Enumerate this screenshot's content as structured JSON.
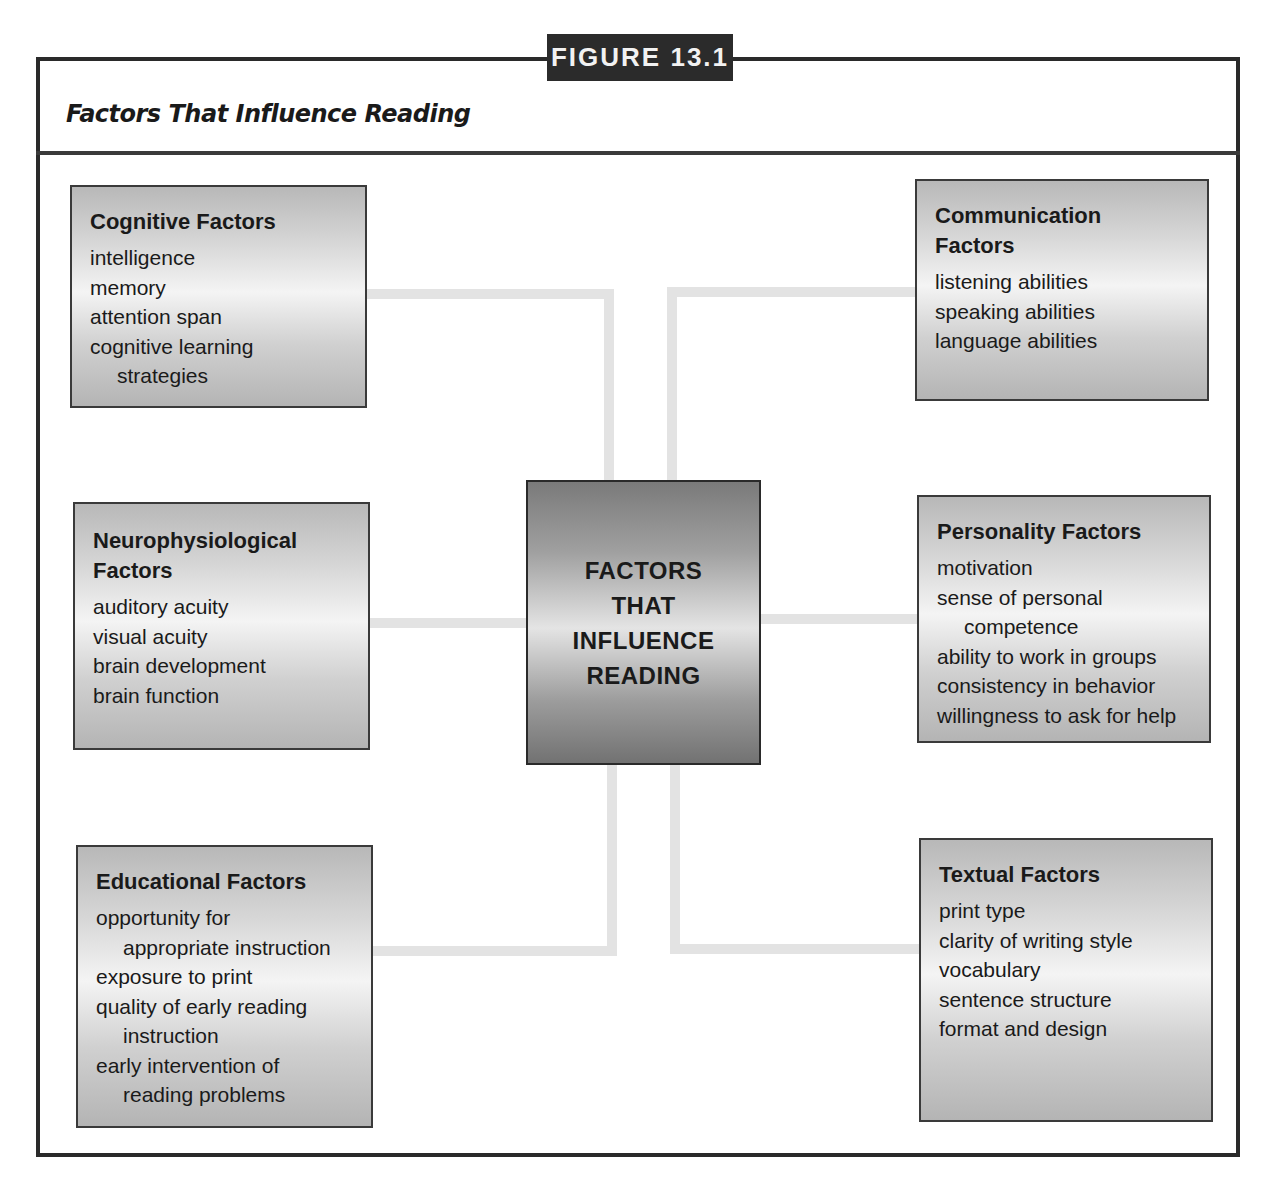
{
  "figure": {
    "label": "FIGURE 13.1",
    "title": "Factors That Influence Reading"
  },
  "center": {
    "lines": [
      "FACTORS",
      "THAT",
      "INFLUENCE",
      "READING"
    ]
  },
  "factors": {
    "cognitive": {
      "title": "Cognitive Factors",
      "items": [
        "intelligence",
        "memory",
        "attention span",
        "cognitive learning",
        "strategies"
      ]
    },
    "communication": {
      "title_line1": "Communication",
      "title_line2": "Factors",
      "items": [
        "listening abilities",
        "speaking abilities",
        "language abilities"
      ]
    },
    "neurophysiological": {
      "title_line1": "Neurophysiological",
      "title_line2": "Factors",
      "items": [
        "auditory acuity",
        "visual acuity",
        "brain development",
        "brain function"
      ]
    },
    "personality": {
      "title": "Personality Factors",
      "items": [
        "motivation",
        "sense of personal",
        "competence",
        "ability to work in groups",
        "consistency in behavior",
        "willingness to ask for help"
      ]
    },
    "educational": {
      "title": "Educational Factors",
      "items": [
        "opportunity for",
        "appropriate instruction",
        "exposure to print",
        "quality of early reading",
        "instruction",
        "early intervention of",
        "reading problems"
      ]
    },
    "textual": {
      "title": "Textual Factors",
      "items": [
        "print type",
        "clarity of writing style",
        "vocabulary",
        "sentence structure",
        "format and design"
      ]
    }
  },
  "colors": {
    "frame": "#2a2a2a",
    "label_bg": "#2b2b2b",
    "connector": "#e3e3e3"
  }
}
